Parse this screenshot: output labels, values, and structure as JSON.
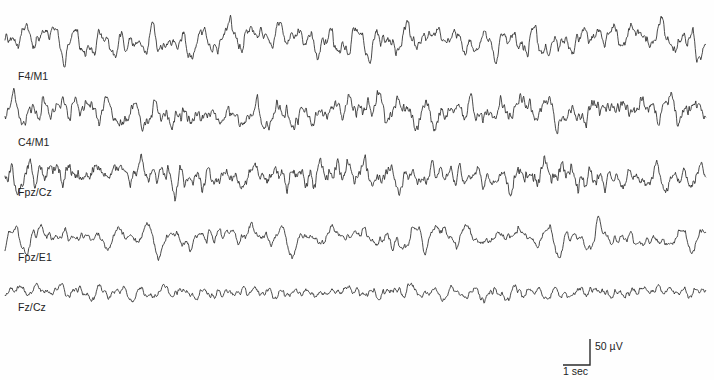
{
  "figure": {
    "type": "eeg-polysomnography-trace",
    "width": 714,
    "height": 380,
    "background_color": "#fefefe",
    "trace_color": "#2b2b2b",
    "trace_line_width": 0.85,
    "plot_left": 5,
    "plot_right": 706
  },
  "chart_data": {
    "type": "line",
    "title": "",
    "subtitle": "",
    "xlabel": "",
    "ylabel": "",
    "grid": false,
    "legend_position": "none",
    "x": {
      "unit": "seconds",
      "scale_reference": "1 sec",
      "pixels_per_second": 28,
      "total_duration_sec": 25
    },
    "y": {
      "unit": "microvolts",
      "scale_reference": "50 uV",
      "pixels_per_50uV": 25
    },
    "series": [
      {
        "name": "F4/M1",
        "label": "F4/M1",
        "label_x": 18,
        "label_y": 71,
        "baseline_y": 40,
        "amplitude_px": 17,
        "dominant_frequency_hz": 1.1,
        "noise_level": 0.42,
        "seed": 10317,
        "description": "frontal EEG, high amplitude slow-wave mixed activity"
      },
      {
        "name": "C4/M1",
        "label": "C4/M1",
        "label_x": 18,
        "label_y": 137,
        "baseline_y": 112,
        "amplitude_px": 16,
        "dominant_frequency_hz": 1.15,
        "noise_level": 0.44,
        "seed": 22481,
        "description": "central EEG, high amplitude slow-wave mixed activity"
      },
      {
        "name": "Fpz/Cz",
        "label": "Fpz/Cz",
        "label_x": 18,
        "label_y": 187,
        "baseline_y": 176,
        "amplitude_px": 15,
        "dominant_frequency_hz": 1.25,
        "noise_level": 0.46,
        "seed": 34907,
        "description": "fronto-polar to central midline derivation"
      },
      {
        "name": "Fpz/E1",
        "label": "Fpz/E1",
        "label_x": 18,
        "label_y": 252,
        "baseline_y": 238,
        "amplitude_px": 13,
        "dominant_frequency_hz": 1.05,
        "noise_level": 0.38,
        "seed": 47115,
        "description": "fronto-polar to left eye reference, EOG contaminated"
      },
      {
        "name": "Fz/Cz",
        "label": "Fz/Cz",
        "label_x": 18,
        "label_y": 302,
        "baseline_y": 292,
        "amplitude_px": 7,
        "dominant_frequency_hz": 1.35,
        "noise_level": 0.55,
        "seed": 58223,
        "description": "midline frontal to central, low amplitude"
      }
    ]
  },
  "scale_bar": {
    "name": "calibration-scale-bar",
    "corner_x": 590,
    "corner_y": 365,
    "vertical_top_y": 339,
    "horizontal_left_x": 563,
    "stroke_color": "#2b2b2b",
    "stroke_width": 1.4,
    "amplitude_label": "50 µV",
    "amplitude_label_x": 595,
    "amplitude_label_y": 341,
    "time_label": "1 sec",
    "time_label_x": 563,
    "time_label_y": 366
  }
}
